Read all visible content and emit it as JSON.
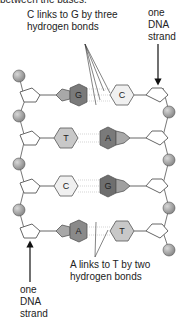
{
  "texts": {
    "header_cut": "between the bases.",
    "cg_label_line1": "C links to G by three",
    "cg_label_line2": "hydrogen bonds",
    "strand_top_line1": "one",
    "strand_top_line2": "DNA",
    "strand_top_line3": "strand",
    "at_label_line1": "A links to T by two",
    "at_label_line2": "hydrogen bonds",
    "strand_bot_line1": "one",
    "strand_bot_line2": "DNA",
    "strand_bot_line3": "strand"
  },
  "pairs": [
    {
      "left": "G",
      "right": "C",
      "bonds": 3
    },
    {
      "left": "T",
      "right": "A",
      "bonds": 2
    },
    {
      "left": "C",
      "right": "G",
      "bonds": 3
    },
    {
      "left": "A",
      "right": "T",
      "bonds": 2
    }
  ],
  "colors": {
    "phosphate": "#9a9a9a",
    "sugar_stroke": "#666666",
    "purine_dark": "#7a7a7a",
    "purine_light": "#a8a8a8",
    "pyrimidine_fill": "#e6e6e6",
    "line": "#555555"
  }
}
